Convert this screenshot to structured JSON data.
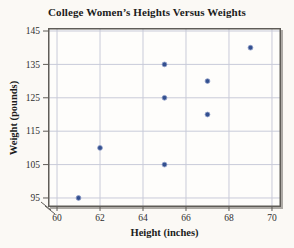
{
  "chart_data": {
    "type": "scatter",
    "title": "College Women’s Heights Versus Weights",
    "xlabel": "Height (inches)",
    "ylabel": "Weight (pounds)",
    "points": [
      {
        "height": 61,
        "weight": 95
      },
      {
        "height": 62,
        "weight": 110
      },
      {
        "height": 65,
        "weight": 105
      },
      {
        "height": 65,
        "weight": 125
      },
      {
        "height": 65,
        "weight": 135
      },
      {
        "height": 67,
        "weight": 120
      },
      {
        "height": 67,
        "weight": 130
      },
      {
        "height": 69,
        "weight": 140
      }
    ],
    "x_ticks": [
      60,
      62,
      64,
      66,
      68,
      70
    ],
    "y_ticks": [
      95,
      105,
      115,
      125,
      135,
      145
    ],
    "xlim": [
      59.58,
      70.42
    ],
    "ylim": [
      92.3,
      145.9
    ],
    "grid": true,
    "legend": "none",
    "axis_break_at_origin": true,
    "colors": {
      "point_fill": "#33508f",
      "point_edge": "#8d9ac7",
      "grid": "#c9cbd9",
      "frame": "#5f5c57",
      "plot_bg": "#fefdfb",
      "page_bg": "#fbf9f5"
    }
  }
}
